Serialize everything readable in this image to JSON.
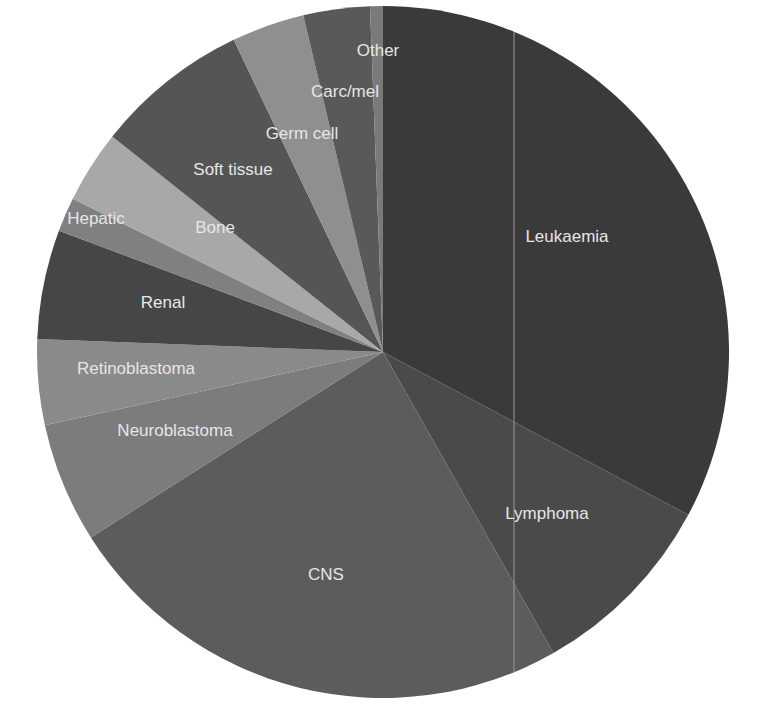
{
  "chart_data": {
    "type": "pie",
    "title": "",
    "start_angle_deg": 0,
    "direction": "clockwise",
    "unit": "percent (estimated from slice angles)",
    "categories": [
      "Leukaemia",
      "Lymphoma",
      "CNS",
      "Neuroblastoma",
      "Retinoblastoma",
      "Renal",
      "Hepatic",
      "Bone",
      "Soft tissue",
      "Germ cell",
      "Carc/mel",
      "Other"
    ],
    "values": [
      32.8,
      9.0,
      24.2,
      5.6,
      4.0,
      5.1,
      1.6,
      3.4,
      7.2,
      3.4,
      3.1,
      0.6
    ],
    "colors": [
      "#3a3a3a",
      "#4a4a4a",
      "#5c5c5c",
      "#7c7c7c",
      "#8a8a8a",
      "#464646",
      "#808080",
      "#a8a8a8",
      "#555555",
      "#8f8f8f",
      "#595959",
      "#7a7a7a"
    ],
    "label_positions": [
      {
        "x": 567,
        "y": 242
      },
      {
        "x": 547,
        "y": 519
      },
      {
        "x": 326,
        "y": 580
      },
      {
        "x": 175,
        "y": 436
      },
      {
        "x": 136,
        "y": 374
      },
      {
        "x": 163,
        "y": 308
      },
      {
        "x": 96,
        "y": 224
      },
      {
        "x": 215,
        "y": 233
      },
      {
        "x": 233,
        "y": 175
      },
      {
        "x": 302,
        "y": 139
      },
      {
        "x": 345,
        "y": 97
      },
      {
        "x": 378,
        "y": 56
      }
    ],
    "legend": "none (labels drawn on slices)",
    "center": {
      "x": 383,
      "y": 352
    },
    "radius": 346
  },
  "decorations": {
    "guide_line_x": 514
  }
}
